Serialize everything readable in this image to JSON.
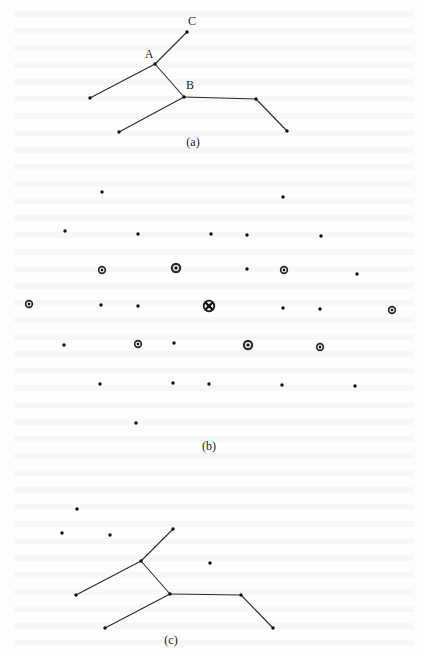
{
  "figure": {
    "panels": [
      {
        "id": "a",
        "caption": "(a)",
        "caption_pos": [
          193,
          146
        ],
        "nodes": [
          {
            "id": "C",
            "x": 187,
            "y": 32,
            "label": "C",
            "label_pos": [
              192,
              25
            ]
          },
          {
            "id": "A",
            "x": 155,
            "y": 64,
            "label": "A",
            "label_pos": [
              149,
              58
            ]
          },
          {
            "id": "L1",
            "x": 90,
            "y": 98
          },
          {
            "id": "B",
            "x": 184,
            "y": 97,
            "label": "B",
            "label_pos": [
              190,
              89
            ]
          },
          {
            "id": "L2",
            "x": 119,
            "y": 132
          },
          {
            "id": "R1",
            "x": 256,
            "y": 99
          },
          {
            "id": "R2",
            "x": 287,
            "y": 131
          }
        ],
        "edges": [
          [
            "A",
            "C"
          ],
          [
            "A",
            "L1"
          ],
          [
            "A",
            "B"
          ],
          [
            "B",
            "L2"
          ],
          [
            "B",
            "R1"
          ],
          [
            "R1",
            "R2"
          ]
        ]
      },
      {
        "id": "b",
        "caption": "(b)",
        "caption_pos": [
          209,
          450
        ],
        "points": [
          {
            "x": 102,
            "y": 192,
            "type": "dot"
          },
          {
            "x": 283,
            "y": 197,
            "type": "dot"
          },
          {
            "x": 65,
            "y": 231,
            "type": "dot"
          },
          {
            "x": 138,
            "y": 234,
            "type": "dot"
          },
          {
            "x": 211,
            "y": 234,
            "type": "dot"
          },
          {
            "x": 247,
            "y": 235,
            "type": "dot"
          },
          {
            "x": 321,
            "y": 236,
            "type": "dot"
          },
          {
            "x": 102,
            "y": 270,
            "type": "circled"
          },
          {
            "x": 176,
            "y": 268,
            "type": "circled-large"
          },
          {
            "x": 247,
            "y": 269,
            "type": "dot"
          },
          {
            "x": 284,
            "y": 270,
            "type": "circled"
          },
          {
            "x": 357,
            "y": 274,
            "type": "dot"
          },
          {
            "x": 29,
            "y": 304,
            "type": "circled"
          },
          {
            "x": 101,
            "y": 305,
            "type": "dot"
          },
          {
            "x": 138,
            "y": 306,
            "type": "dot"
          },
          {
            "x": 209,
            "y": 306,
            "type": "crossed"
          },
          {
            "x": 283,
            "y": 308,
            "type": "dot"
          },
          {
            "x": 320,
            "y": 309,
            "type": "dot"
          },
          {
            "x": 392,
            "y": 310,
            "type": "circled"
          },
          {
            "x": 64,
            "y": 345,
            "type": "dot"
          },
          {
            "x": 138,
            "y": 344,
            "type": "circled"
          },
          {
            "x": 174,
            "y": 343,
            "type": "dot"
          },
          {
            "x": 248,
            "y": 345,
            "type": "circled-large"
          },
          {
            "x": 320,
            "y": 347,
            "type": "circled"
          },
          {
            "x": 100,
            "y": 384,
            "type": "dot"
          },
          {
            "x": 173,
            "y": 383,
            "type": "dot"
          },
          {
            "x": 209,
            "y": 384,
            "type": "dot"
          },
          {
            "x": 282,
            "y": 385,
            "type": "dot"
          },
          {
            "x": 355,
            "y": 386,
            "type": "dot"
          },
          {
            "x": 136,
            "y": 423,
            "type": "dot"
          }
        ]
      },
      {
        "id": "c",
        "caption": "(c)",
        "caption_pos": [
          171,
          644
        ],
        "nodes": [
          {
            "id": "P1",
            "x": 77,
            "y": 509
          },
          {
            "id": "P2",
            "x": 62,
            "y": 533
          },
          {
            "id": "P3",
            "x": 110,
            "y": 535
          },
          {
            "id": "P4",
            "x": 210,
            "y": 563
          },
          {
            "id": "C",
            "x": 173,
            "y": 529
          },
          {
            "id": "A",
            "x": 141,
            "y": 561
          },
          {
            "id": "L1",
            "x": 76,
            "y": 595
          },
          {
            "id": "B",
            "x": 170,
            "y": 594
          },
          {
            "id": "L2",
            "x": 105,
            "y": 628
          },
          {
            "id": "R1",
            "x": 241,
            "y": 595
          },
          {
            "id": "R2",
            "x": 273,
            "y": 628
          }
        ],
        "edges": [
          [
            "A",
            "C"
          ],
          [
            "A",
            "L1"
          ],
          [
            "A",
            "B"
          ],
          [
            "B",
            "L2"
          ],
          [
            "B",
            "R1"
          ],
          [
            "R1",
            "R2"
          ]
        ]
      }
    ]
  }
}
